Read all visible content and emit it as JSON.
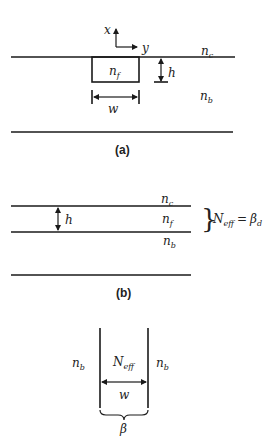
{
  "panels": [
    {
      "caption": "(a)",
      "axes": {
        "x_label": "x",
        "y_label": "y"
      },
      "labels": {
        "cladding": "n",
        "cladding_sub": "c",
        "film": "n",
        "film_sub": "f",
        "substrate": "n",
        "substrate_sub": "b",
        "height": "h",
        "width": "w"
      }
    },
    {
      "caption": "(b)",
      "labels": {
        "cladding": "n",
        "cladding_sub": "c",
        "film": "n",
        "film_sub": "f",
        "substrate": "n",
        "substrate_sub": "b",
        "height": "h",
        "neff": "N",
        "neff_sub": "eff",
        "equals": "=",
        "beta": "β",
        "beta_sub": "d"
      }
    },
    {
      "caption": "",
      "labels": {
        "left_index": "n",
        "left_index_sub": "b",
        "right_index": "n",
        "right_index_sub": "b",
        "core_index": "N",
        "core_index_sub": "eff",
        "width": "w",
        "beta": "β"
      }
    }
  ],
  "colors": {
    "stroke": "#1a1a1a",
    "text": "#222222",
    "background": "#ffffff"
  }
}
